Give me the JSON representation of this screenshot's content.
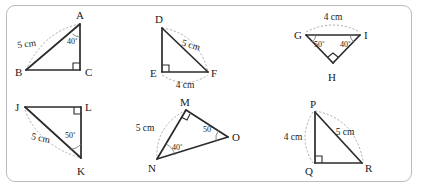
{
  "worksheet": {
    "frame": {
      "border_color": "#b9bcc0",
      "background_color": "#ffffff"
    },
    "line_color": "#2b2b2b",
    "arc_color": "#9a9a9a"
  },
  "figures": [
    {
      "id": "triangle-abc",
      "vertices": [
        {
          "name": "A",
          "label": "A",
          "x": 80,
          "y": 24,
          "label_x": 76,
          "label_y": 19
        },
        {
          "name": "B",
          "label": "B",
          "x": 26,
          "y": 70,
          "label_x": 15,
          "label_y": 76
        },
        {
          "name": "C",
          "label": "C",
          "x": 80,
          "y": 70,
          "label_x": 85,
          "label_y": 76
        }
      ],
      "right_angle_at": "C",
      "measures": [
        {
          "text": "5 cm",
          "x": 27,
          "y": 47,
          "edge": "AB"
        }
      ],
      "angles": [
        {
          "text": "40˚",
          "x": 67,
          "y": 44,
          "at": "A"
        }
      ]
    },
    {
      "id": "triangle-def",
      "vertices": [
        {
          "name": "D",
          "label": "D",
          "x": 162,
          "y": 28,
          "label_x": 155,
          "label_y": 22
        },
        {
          "name": "E",
          "label": "E",
          "x": 162,
          "y": 72,
          "label_x": 150,
          "label_y": 77
        },
        {
          "name": "F",
          "label": "F",
          "x": 208,
          "y": 72,
          "label_x": 212,
          "label_y": 77
        }
      ],
      "right_angle_at": "E",
      "measures": [
        {
          "text": "5 cm",
          "x": 189,
          "y": 47,
          "edge": "DF"
        },
        {
          "text": "4 cm",
          "x": 185,
          "y": 87,
          "edge": "EF"
        }
      ],
      "angles": []
    },
    {
      "id": "triangle-ghi",
      "vertices": [
        {
          "name": "G",
          "label": "G",
          "x": 306,
          "y": 35,
          "label_x": 296,
          "label_y": 39
        },
        {
          "name": "I",
          "label": "I",
          "x": 360,
          "y": 35,
          "label_x": 364,
          "label_y": 39
        },
        {
          "name": "H",
          "label": "H",
          "x": 333,
          "y": 63,
          "label_x": 329,
          "label_y": 80
        }
      ],
      "right_angle_at": "H",
      "measures": [
        {
          "text": "4 cm",
          "x": 333,
          "y": 20,
          "edge": "GI"
        }
      ],
      "angles": [
        {
          "text": "50˚",
          "x": 319,
          "y": 46,
          "at": "G"
        },
        {
          "text": "40˚",
          "x": 347,
          "y": 46,
          "at": "I"
        }
      ]
    },
    {
      "id": "triangle-jkl",
      "vertices": [
        {
          "name": "J",
          "label": "J",
          "x": 25,
          "y": 107,
          "label_x": 16,
          "label_y": 110
        },
        {
          "name": "L",
          "label": "L",
          "x": 81,
          "y": 107,
          "label_x": 85,
          "label_y": 110
        },
        {
          "name": "K",
          "label": "K",
          "x": 81,
          "y": 158,
          "label_x": 78,
          "label_y": 175
        }
      ],
      "right_angle_at": "L",
      "measures": [
        {
          "text": "5 cm",
          "x": 37,
          "y": 140,
          "edge": "JK"
        }
      ],
      "angles": [
        {
          "text": "50˚",
          "x": 69,
          "y": 137,
          "at": "K"
        }
      ]
    },
    {
      "id": "triangle-mno",
      "vertices": [
        {
          "name": "M",
          "label": "M",
          "x": 186,
          "y": 110,
          "label_x": 181,
          "label_y": 105
        },
        {
          "name": "N",
          "label": "N",
          "x": 157,
          "y": 159,
          "label_x": 149,
          "label_y": 171
        },
        {
          "name": "O",
          "label": "O",
          "x": 228,
          "y": 137,
          "label_x": 232,
          "label_y": 140
        }
      ],
      "right_angle_at": "M",
      "measures": [
        {
          "text": "5 cm",
          "x": 143,
          "y": 130,
          "edge": "MN"
        }
      ],
      "angles": [
        {
          "text": "40˚",
          "x": 175,
          "y": 148,
          "at": "N"
        },
        {
          "text": "50˚",
          "x": 209,
          "y": 131,
          "at": "O"
        }
      ]
    },
    {
      "id": "triangle-pqr",
      "vertices": [
        {
          "name": "P",
          "label": "P",
          "x": 315,
          "y": 112,
          "label_x": 310,
          "label_y": 107
        },
        {
          "name": "Q",
          "label": "Q",
          "x": 315,
          "y": 163,
          "label_x": 306,
          "label_y": 175
        },
        {
          "name": "R",
          "label": "R",
          "x": 362,
          "y": 163,
          "label_x": 366,
          "label_y": 172
        }
      ],
      "right_angle_at": "Q",
      "measures": [
        {
          "text": "4 cm",
          "x": 293,
          "y": 139,
          "edge": "PQ"
        },
        {
          "text": "5 cm",
          "x": 344,
          "y": 134,
          "edge": "PR"
        }
      ],
      "angles": []
    }
  ]
}
